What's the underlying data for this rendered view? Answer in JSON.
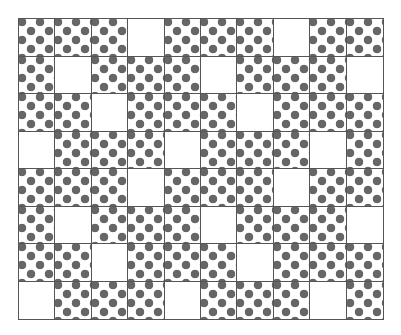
{
  "figure": {
    "rows": 8,
    "cols": 10,
    "dot_color": "#666666",
    "border_color": "#555555",
    "background": "#ffffff",
    "blank_cells": [
      [
        0,
        3
      ],
      [
        0,
        7
      ],
      [
        1,
        1
      ],
      [
        1,
        5
      ],
      [
        1,
        9
      ],
      [
        2,
        2
      ],
      [
        2,
        6
      ],
      [
        3,
        0
      ],
      [
        3,
        4
      ],
      [
        3,
        8
      ],
      [
        4,
        3
      ],
      [
        4,
        7
      ],
      [
        5,
        1
      ],
      [
        5,
        5
      ],
      [
        5,
        9
      ],
      [
        6,
        2
      ],
      [
        6,
        6
      ],
      [
        7,
        0
      ],
      [
        7,
        4
      ],
      [
        7,
        8
      ]
    ]
  }
}
